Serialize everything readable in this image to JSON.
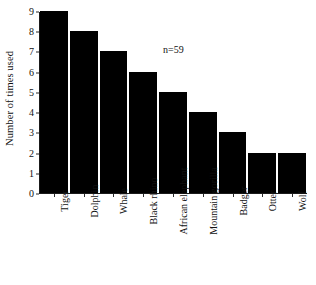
{
  "chart_data": {
    "type": "bar",
    "title": "",
    "xlabel": "",
    "ylabel": "Number of times used",
    "categories": [
      "Tiger",
      "Dolphin",
      "Whale",
      "Black rhino",
      "African elephant",
      "Mountain gorilla",
      "Badger",
      "Otter",
      "Wolf"
    ],
    "values": [
      9,
      8,
      7,
      6,
      5,
      4,
      3,
      2,
      2
    ],
    "ylim": [
      0,
      9
    ],
    "yticks": [
      0,
      1,
      2,
      3,
      4,
      5,
      6,
      7,
      8,
      9
    ],
    "ytick_labels": [
      "0",
      "1",
      "2",
      "3",
      "4",
      "5",
      "6",
      "7",
      "8",
      "9"
    ],
    "grid": false,
    "legend": false,
    "annotations": [
      {
        "text": "n=59",
        "x": 4.2,
        "y": 7.4
      }
    ],
    "bar_color": "#000000",
    "background_color": "#ffffff",
    "axis_color": "#1a1a1a"
  },
  "annotation_text": "n=59"
}
